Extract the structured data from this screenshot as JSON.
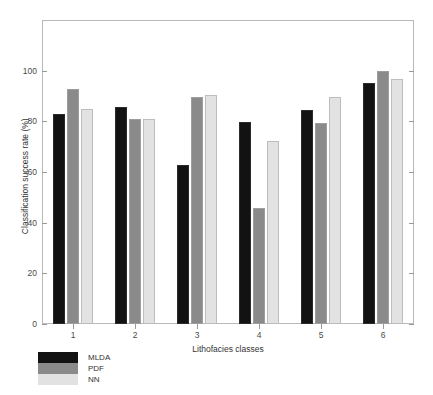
{
  "chart_data": {
    "type": "bar",
    "title": "",
    "xlabel": "Lithofacies classes",
    "ylabel": "Classification success rate (%)",
    "categories": [
      "1",
      "2",
      "3",
      "4",
      "5",
      "6"
    ],
    "ylim": [
      0,
      120
    ],
    "yticks": [
      0,
      20,
      40,
      60,
      80,
      100
    ],
    "ytick_labels": [
      "0",
      "20",
      "40",
      "60",
      "80",
      "100"
    ],
    "grid": false,
    "legend_position": "below-left",
    "series": [
      {
        "name": "MLDA",
        "color": "#121212",
        "values": [
          83,
          85.8,
          62.8,
          79.6,
          84.5,
          95.3
        ]
      },
      {
        "name": "PDF",
        "color": "#8a8a8a",
        "values": [
          92.7,
          80.8,
          89.5,
          45.7,
          79.2,
          99.9
        ]
      },
      {
        "name": "NN",
        "color": "#e2e2e2",
        "values": [
          84.7,
          80.8,
          90.4,
          72.4,
          89.7,
          96.7
        ]
      }
    ]
  },
  "legend": {
    "entries": [
      {
        "label": "MLDA",
        "color": "#121212"
      },
      {
        "label": "PDF",
        "color": "#8a8a8a"
      },
      {
        "label": "NN",
        "color": "#e2e2e2"
      }
    ]
  },
  "colors": {
    "axis": "#b9b9b9",
    "tick": "#9a9a9a",
    "text": "#333333",
    "background": "#ffffff"
  }
}
